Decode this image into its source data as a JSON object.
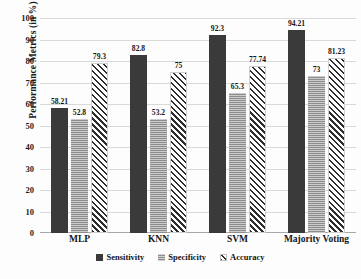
{
  "chart_data": {
    "type": "bar",
    "title": "",
    "xlabel": "",
    "ylabel": "Performance Metrics (in %)",
    "ylim": [
      0,
      100
    ],
    "yticks": [
      0,
      10,
      20,
      30,
      40,
      50,
      60,
      70,
      80,
      90,
      100
    ],
    "grid": true,
    "legend_position": "bottom",
    "categories": [
      "MLP",
      "KNN",
      "SVM",
      "Majority Voting"
    ],
    "series": [
      {
        "name": "Sensitivity",
        "color": "#3a3a3a",
        "pattern": "solid",
        "values": [
          58.21,
          82.8,
          92.3,
          94.21
        ],
        "labels": [
          "58.21",
          "82.8",
          "92.3",
          "94.21"
        ]
      },
      {
        "name": "Specificity",
        "color": "#8d8d8d",
        "pattern": "horizontal-lines",
        "values": [
          52.8,
          53.2,
          65.3,
          73
        ],
        "labels": [
          "52.8",
          "53.2",
          "65.3",
          "73"
        ]
      },
      {
        "name": "Accuracy",
        "color": "#ffffff",
        "pattern": "diagonal-hatch",
        "values": [
          79.3,
          75,
          77.74,
          81.23
        ],
        "labels": [
          "79.3",
          "75",
          "77.74",
          "81.23"
        ]
      }
    ]
  }
}
